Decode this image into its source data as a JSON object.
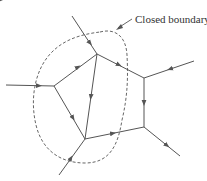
{
  "diagram": {
    "annotation": "Closed boundary",
    "nodes": [
      {
        "id": "A",
        "x": 97,
        "y": 54
      },
      {
        "id": "B",
        "x": 54,
        "y": 86
      },
      {
        "id": "C",
        "x": 85,
        "y": 139
      },
      {
        "id": "D",
        "x": 144,
        "y": 78
      },
      {
        "id": "E",
        "x": 144,
        "y": 127
      }
    ],
    "external_points": [
      {
        "id": "P1",
        "x": 72,
        "y": 16
      },
      {
        "id": "P2",
        "x": 6,
        "y": 85
      },
      {
        "id": "P3",
        "x": 194,
        "y": 61
      },
      {
        "id": "P4",
        "x": 180,
        "y": 156
      },
      {
        "id": "P5",
        "x": 59,
        "y": 175
      }
    ],
    "edges": [
      {
        "from": "P1",
        "to": "A"
      },
      {
        "from": "P2",
        "to": "B"
      },
      {
        "from": "B",
        "to": "A"
      },
      {
        "from": "A",
        "to": "C"
      },
      {
        "from": "B",
        "to": "C"
      },
      {
        "from": "A",
        "to": "D"
      },
      {
        "from": "P3",
        "to": "D"
      },
      {
        "from": "D",
        "to": "E"
      },
      {
        "from": "C",
        "to": "E"
      },
      {
        "from": "E",
        "to": "P4"
      },
      {
        "from": "P5",
        "to": "C"
      }
    ],
    "colors": {
      "line": "#555555",
      "boundary": "#555555"
    }
  }
}
